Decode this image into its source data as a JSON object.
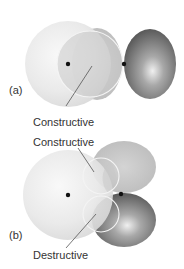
{
  "figure": {
    "panels": [
      {
        "id": "a",
        "label": "(a)",
        "annotations": [
          {
            "text": "Constructive"
          }
        ],
        "description": "s orbital overlapping the positive lobe of a p orbital along the bond axis"
      },
      {
        "id": "b",
        "label": "(b)",
        "annotations": [
          {
            "text": "Constructive"
          },
          {
            "text": "Destructive"
          }
        ],
        "description": "s orbital overlapping a p orbital perpendicular to the bond axis"
      }
    ]
  },
  "colors": {
    "s_orbital": "#e6e6e6",
    "light_lobe": "#c4c4c4",
    "dark_lobe": "#6a6a6a",
    "nucleus": "#111111",
    "overlap_outline": "#f4f4f4",
    "text": "#333333"
  }
}
